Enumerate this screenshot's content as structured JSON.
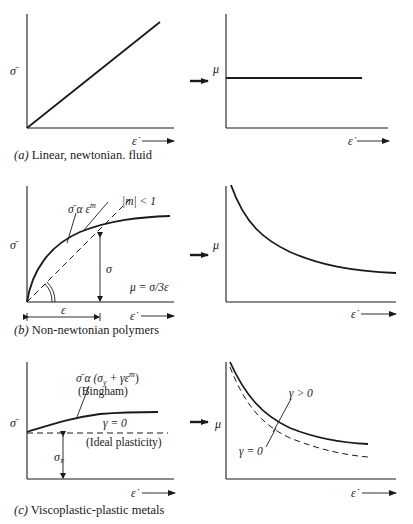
{
  "figure": {
    "panels": [
      {
        "id": "a",
        "caption_letter": "(a)",
        "caption_text": " Linear, newtonian. fluid",
        "left_plot": {
          "ylabel": "σ̄",
          "xlabel": "ε̇",
          "curve": "linear"
        },
        "right_plot": {
          "ylabel": "μ",
          "xlabel": "ε̇",
          "curve": "constant"
        }
      },
      {
        "id": "b",
        "caption_letter": "(b)",
        "caption_text": " Non-newtonian polymers",
        "left_plot": {
          "ylabel": "σ̄",
          "xlabel": "ε̇",
          "curve_label": "σ̄ α ε",
          "curve_label_exp": "m",
          "secant_label": "|m| < 1",
          "vertical_label": "σ",
          "viscosity_label": "μ = σ/3ε",
          "span_label": "ε"
        },
        "right_plot": {
          "ylabel": "μ",
          "xlabel": "ε̇",
          "curve": "decreasing"
        }
      },
      {
        "id": "c",
        "caption_letter": "(c)",
        "caption_text": " Viscoplastic-plastic metals",
        "left_plot": {
          "ylabel": "σ̄",
          "xlabel": "ε̇",
          "curve_label": "σ̄ α (σ",
          "curve_label_sub": "y",
          "curve_label_mid": " + γε",
          "curve_label_exp": "m",
          "curve_label_end": ")",
          "curve_sublabel": "(Bingham)",
          "dashed_label": "γ = 0",
          "dashed_sublabel": "(Ideal plasticity)",
          "yield_label": "σ",
          "yield_label_sub": "Y"
        },
        "right_plot": {
          "ylabel": "μ",
          "xlabel": "ε̇",
          "solid_label": "γ > 0",
          "dashed_label": "γ = 0"
        }
      }
    ]
  }
}
